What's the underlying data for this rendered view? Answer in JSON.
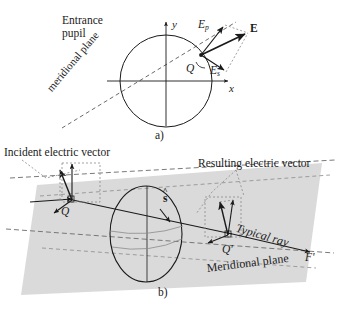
{
  "figure": {
    "background_color": "#ffffff",
    "ink_color": "#1a1a1a",
    "plane_fill": "#d8d8d8",
    "panels": [
      {
        "id": "a",
        "caption": "a)"
      },
      {
        "id": "b",
        "caption": "b)"
      }
    ]
  },
  "panel_a": {
    "caption": "a)",
    "entrance_pupil_label_line1": "Entrance",
    "entrance_pupil_label_line2": "pupil",
    "axis_y_label": "y",
    "axis_x_label": "x",
    "point_label": "Q",
    "meridional_label": "meridional plane",
    "vectors": [
      {
        "name": "Ep",
        "symbol": "E",
        "subscript": "p",
        "description": "p-polarization component"
      },
      {
        "name": "Es",
        "symbol": "E",
        "subscript": "s",
        "description": "s-polarization component"
      },
      {
        "name": "E",
        "symbol": "E",
        "subscript": "",
        "description": "resultant electric vector"
      }
    ]
  },
  "panel_b": {
    "caption": "b)",
    "incident_vector_label": "Incident electric vector",
    "resulting_vector_label": "Resulting electric vector",
    "point_label_left": "Q",
    "point_label_right": "Q'",
    "ray_direction_label": "s",
    "typical_ray_label": "Typical ray",
    "focus_label": "F'",
    "meridional_plane_label": "Meridional plane"
  }
}
